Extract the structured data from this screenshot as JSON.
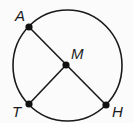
{
  "diagram": {
    "type": "circle-geometry",
    "stroke_color": "#1a1a1a",
    "background": "#fbfbfb",
    "circle": {
      "cx": 67.5,
      "cy": 65.5,
      "rx": 54.5,
      "ry": 55.5
    },
    "points": [
      {
        "id": "A",
        "label": "A",
        "x": 29,
        "y": 27,
        "label_x": 15,
        "label_y": 21,
        "role": "on circle"
      },
      {
        "id": "M",
        "label": "M",
        "x": 66,
        "y": 65,
        "label_x": 71,
        "label_y": 59,
        "role": "center"
      },
      {
        "id": "T",
        "label": "T",
        "x": 29,
        "y": 104,
        "label_x": 12,
        "label_y": 117,
        "role": "on circle"
      },
      {
        "id": "H",
        "label": "H",
        "x": 106,
        "y": 105,
        "label_x": 112,
        "label_y": 117,
        "role": "on circle"
      }
    ],
    "segments": [
      {
        "from": "A",
        "to": "H",
        "description": "diameter through M"
      },
      {
        "from": "M",
        "to": "T",
        "description": "radius"
      }
    ]
  }
}
